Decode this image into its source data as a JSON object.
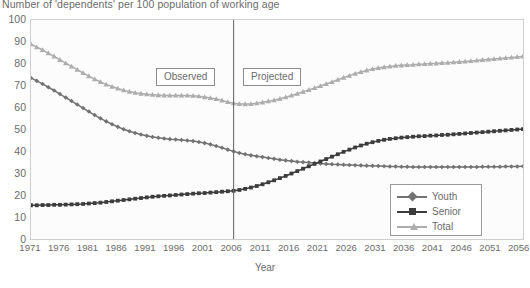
{
  "chart_data": {
    "type": "line",
    "title": "Number of 'dependents' per 100 population of working age",
    "xlabel": "Year",
    "ylabel": "",
    "xlim": [
      1971,
      2056
    ],
    "ylim": [
      0,
      100
    ],
    "grid": false,
    "legend_position": "bottom-right",
    "x": [
      1971,
      1972,
      1973,
      1974,
      1975,
      1976,
      1977,
      1978,
      1979,
      1980,
      1981,
      1982,
      1983,
      1984,
      1985,
      1986,
      1987,
      1988,
      1989,
      1990,
      1991,
      1992,
      1993,
      1994,
      1995,
      1996,
      1997,
      1998,
      1999,
      2000,
      2001,
      2002,
      2003,
      2004,
      2005,
      2006,
      2007,
      2008,
      2009,
      2010,
      2011,
      2012,
      2013,
      2014,
      2015,
      2016,
      2017,
      2018,
      2019,
      2020,
      2021,
      2022,
      2023,
      2024,
      2025,
      2026,
      2027,
      2028,
      2029,
      2030,
      2031,
      2032,
      2033,
      2034,
      2035,
      2036,
      2037,
      2038,
      2039,
      2040,
      2041,
      2042,
      2043,
      2044,
      2045,
      2046,
      2047,
      2048,
      2049,
      2050,
      2051,
      2052,
      2053,
      2054,
      2055,
      2056
    ],
    "tick_labels_x": [
      "1971",
      "1976",
      "1981",
      "1986",
      "1991",
      "1996",
      "2001",
      "2006",
      "2011",
      "2016",
      "2021",
      "2026",
      "2031",
      "2036",
      "2041",
      "2046",
      "2051",
      "2056"
    ],
    "tick_labels_y": [
      "0",
      "10",
      "20",
      "30",
      "40",
      "50",
      "60",
      "70",
      "80",
      "90",
      "100"
    ],
    "series": [
      {
        "name": "Youth",
        "marker": "diamond",
        "color": "#737373",
        "values": [
          73.5,
          72.2,
          70.8,
          69.3,
          67.8,
          66.2,
          64.6,
          63.0,
          61.4,
          59.8,
          58.2,
          56.6,
          55.1,
          53.7,
          52.4,
          51.2,
          50.1,
          49.2,
          48.4,
          47.7,
          47.1,
          46.6,
          46.2,
          45.9,
          45.6,
          45.4,
          45.2,
          45.0,
          44.7,
          44.3,
          43.8,
          43.2,
          42.5,
          41.7,
          40.8,
          40.0,
          39.3,
          38.7,
          38.2,
          37.8,
          37.4,
          37.0,
          36.6,
          36.2,
          35.9,
          35.6,
          35.3,
          35.1,
          34.9,
          34.7,
          34.5,
          34.3,
          34.1,
          34.0,
          33.9,
          33.8,
          33.7,
          33.6,
          33.5,
          33.4,
          33.3,
          33.2,
          33.1,
          33.1,
          33.0,
          33.0,
          32.9,
          32.9,
          32.9,
          32.9,
          32.9,
          32.9,
          32.9,
          32.9,
          32.9,
          32.9,
          32.9,
          32.9,
          33.0,
          33.0,
          33.0,
          33.0,
          33.1,
          33.1,
          33.1,
          33.2
        ]
      },
      {
        "name": "Senior",
        "marker": "square",
        "color": "#3c3c3c",
        "values": [
          15.4,
          15.4,
          15.5,
          15.5,
          15.6,
          15.6,
          15.7,
          15.8,
          15.9,
          16.0,
          16.2,
          16.4,
          16.6,
          16.9,
          17.2,
          17.5,
          17.8,
          18.1,
          18.4,
          18.7,
          19.0,
          19.3,
          19.5,
          19.7,
          19.9,
          20.1,
          20.3,
          20.5,
          20.7,
          20.9,
          21.0,
          21.2,
          21.4,
          21.6,
          21.8,
          22.0,
          22.4,
          22.9,
          23.5,
          24.2,
          25.0,
          25.9,
          26.8,
          27.8,
          28.8,
          29.9,
          31.0,
          32.1,
          33.2,
          34.3,
          35.4,
          36.5,
          37.6,
          38.7,
          39.8,
          40.8,
          41.8,
          42.7,
          43.5,
          44.2,
          44.8,
          45.3,
          45.7,
          46.0,
          46.3,
          46.5,
          46.7,
          46.9,
          47.0,
          47.2,
          47.3,
          47.5,
          47.6,
          47.8,
          48.0,
          48.2,
          48.4,
          48.6,
          48.8,
          49.0,
          49.2,
          49.4,
          49.6,
          49.8,
          50.0,
          50.2
        ]
      },
      {
        "name": "Total",
        "marker": "triangle",
        "color": "#adadad",
        "values": [
          89.0,
          87.6,
          86.3,
          84.8,
          83.4,
          81.8,
          80.3,
          78.8,
          77.3,
          75.8,
          74.4,
          73.0,
          71.7,
          70.6,
          69.6,
          68.7,
          67.9,
          67.3,
          66.8,
          66.4,
          66.1,
          65.9,
          65.7,
          65.6,
          65.5,
          65.5,
          65.5,
          65.5,
          65.4,
          65.2,
          64.8,
          64.4,
          63.9,
          63.3,
          62.6,
          62.0,
          61.7,
          61.6,
          61.7,
          62.0,
          62.4,
          62.9,
          63.4,
          64.0,
          64.7,
          65.5,
          66.3,
          67.2,
          68.1,
          69.0,
          69.9,
          70.8,
          71.7,
          72.7,
          73.7,
          74.6,
          75.5,
          76.3,
          77.0,
          77.6,
          78.1,
          78.5,
          78.8,
          79.1,
          79.3,
          79.5,
          79.6,
          79.8,
          79.9,
          80.1,
          80.2,
          80.4,
          80.5,
          80.7,
          80.9,
          81.1,
          81.3,
          81.5,
          81.8,
          82.0,
          82.2,
          82.4,
          82.7,
          82.9,
          83.1,
          83.4
        ]
      }
    ],
    "annotations": [
      {
        "label": "Observed",
        "x": 1998
      },
      {
        "label": "Projected",
        "x": 2013
      }
    ],
    "divider_year": 2006
  },
  "legend": {
    "items": [
      {
        "label": "Youth"
      },
      {
        "label": "Senior"
      },
      {
        "label": "Total"
      }
    ]
  },
  "axes": {
    "x_title": "Year"
  }
}
